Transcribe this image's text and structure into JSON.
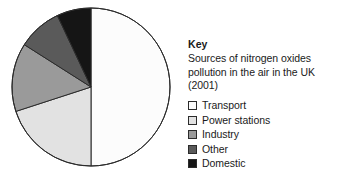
{
  "figure": {
    "legend_heading": "Key",
    "legend_caption": "Sources of nitrogen oxides pollution in the air in the UK (2001)"
  },
  "chart_data": {
    "type": "pie",
    "title": "Sources of nitrogen oxides pollution in the air in the UK (2001)",
    "legend_position": "right",
    "start_angle_deg": 0,
    "direction": "clockwise",
    "categories": [
      "Transport",
      "Power stations",
      "Industry",
      "Other",
      "Domestic"
    ],
    "values": [
      50,
      20,
      14,
      9,
      7
    ],
    "unit": "percent",
    "colors": [
      "#fcfcfc",
      "#e2e2e2",
      "#9a9a9a",
      "#5a5a5a",
      "#151515"
    ],
    "stroke": "#2b2b2b",
    "slices": [
      {
        "label": "Transport",
        "value": 50,
        "color": "#fcfcfc",
        "start_deg": 0,
        "end_deg": 180
      },
      {
        "label": "Power stations",
        "value": 20,
        "color": "#e2e2e2",
        "start_deg": 180,
        "end_deg": 252
      },
      {
        "label": "Industry",
        "value": 14,
        "color": "#9a9a9a",
        "start_deg": 252,
        "end_deg": 302.4
      },
      {
        "label": "Other",
        "value": 9,
        "color": "#5a5a5a",
        "start_deg": 302.4,
        "end_deg": 334.8
      },
      {
        "label": "Domestic",
        "value": 7,
        "color": "#151515",
        "start_deg": 334.8,
        "end_deg": 360
      }
    ],
    "xlabel": "",
    "ylabel": ""
  },
  "legend": {
    "items": [
      {
        "label": "Transport",
        "swatch_color": "#fcfcfc"
      },
      {
        "label": "Power stations",
        "swatch_color": "#e2e2e2"
      },
      {
        "label": "Industry",
        "swatch_color": "#9a9a9a"
      },
      {
        "label": "Other",
        "swatch_color": "#5a5a5a"
      },
      {
        "label": "Domestic",
        "swatch_color": "#151515"
      }
    ]
  }
}
